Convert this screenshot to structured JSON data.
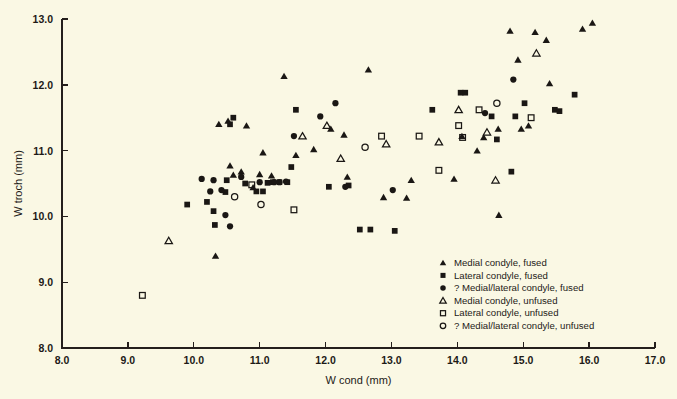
{
  "figure": {
    "background_color": "#faf8e4",
    "ink_color": "#1a1714"
  },
  "chart_data": {
    "type": "scatter",
    "title": "",
    "xlabel": "W cond (mm)",
    "ylabel": "W troch (mm)",
    "xlim": [
      8.0,
      17.0
    ],
    "ylim": [
      8.0,
      13.0
    ],
    "xticks": [
      "8.0",
      "9.0",
      "10.0",
      "11.0",
      "12.0",
      "13.0",
      "14.0",
      "15.0",
      "16.0",
      "17.0"
    ],
    "yticks": [
      "8.0",
      "9.0",
      "10.0",
      "11.0",
      "12.0",
      "13.0"
    ],
    "grid": false,
    "legend_position": "lower-right",
    "series": [
      {
        "name": "Medial condyle, fused",
        "marker": "filled-triangle",
        "points": [
          [
            10.55,
            10.77
          ],
          [
            10.72,
            10.68
          ],
          [
            10.6,
            10.63
          ],
          [
            10.9,
            10.44
          ],
          [
            11.05,
            10.97
          ],
          [
            11.0,
            10.64
          ],
          [
            11.18,
            10.62
          ],
          [
            11.37,
            12.13
          ],
          [
            11.55,
            10.93
          ],
          [
            11.82,
            11.02
          ],
          [
            12.08,
            11.33
          ],
          [
            12.28,
            11.24
          ],
          [
            12.65,
            12.23
          ],
          [
            12.33,
            10.6
          ],
          [
            12.88,
            10.29
          ],
          [
            13.23,
            10.28
          ],
          [
            13.3,
            10.55
          ],
          [
            13.95,
            10.57
          ],
          [
            14.07,
            11.22
          ],
          [
            14.3,
            11.0
          ],
          [
            14.4,
            11.2
          ],
          [
            14.62,
            11.33
          ],
          [
            14.8,
            12.82
          ],
          [
            14.97,
            11.33
          ],
          [
            14.92,
            12.38
          ],
          [
            15.08,
            11.38
          ],
          [
            15.18,
            12.8
          ],
          [
            15.35,
            12.68
          ],
          [
            15.4,
            12.02
          ],
          [
            15.9,
            12.85
          ],
          [
            16.05,
            12.94
          ],
          [
            10.38,
            11.4
          ],
          [
            10.52,
            11.45
          ],
          [
            10.8,
            11.38
          ],
          [
            14.63,
            10.02
          ],
          [
            10.33,
            9.4
          ]
        ]
      },
      {
        "name": "Lateral condyle, fused",
        "marker": "filled-square",
        "points": [
          [
            10.3,
            10.08
          ],
          [
            10.32,
            9.87
          ],
          [
            10.5,
            10.55
          ],
          [
            10.48,
            10.37
          ],
          [
            10.55,
            11.4
          ],
          [
            10.6,
            11.5
          ],
          [
            10.78,
            10.5
          ],
          [
            10.95,
            10.38
          ],
          [
            11.05,
            10.38
          ],
          [
            11.12,
            10.51
          ],
          [
            11.2,
            10.52
          ],
          [
            11.3,
            10.52
          ],
          [
            11.42,
            10.52
          ],
          [
            11.48,
            10.75
          ],
          [
            11.55,
            11.62
          ],
          [
            12.05,
            10.45
          ],
          [
            12.35,
            10.47
          ],
          [
            12.52,
            9.8
          ],
          [
            12.68,
            9.8
          ],
          [
            13.05,
            9.78
          ],
          [
            13.62,
            11.62
          ],
          [
            14.05,
            11.88
          ],
          [
            14.12,
            11.88
          ],
          [
            14.52,
            11.52
          ],
          [
            14.6,
            11.17
          ],
          [
            14.82,
            10.68
          ],
          [
            14.88,
            11.52
          ],
          [
            15.02,
            11.72
          ],
          [
            15.48,
            11.62
          ],
          [
            15.55,
            11.6
          ],
          [
            15.78,
            11.85
          ],
          [
            10.2,
            10.22
          ],
          [
            9.9,
            10.18
          ]
        ]
      },
      {
        "name": "? Medial/lateral condyle, fused",
        "marker": "filled-circle",
        "points": [
          [
            10.12,
            10.57
          ],
          [
            10.3,
            10.55
          ],
          [
            10.48,
            10.02
          ],
          [
            10.55,
            9.85
          ],
          [
            10.72,
            10.6
          ],
          [
            11.0,
            10.52
          ],
          [
            11.22,
            10.52
          ],
          [
            11.3,
            10.52
          ],
          [
            11.4,
            10.53
          ],
          [
            11.52,
            11.22
          ],
          [
            11.92,
            11.52
          ],
          [
            12.15,
            11.72
          ],
          [
            12.3,
            10.45
          ],
          [
            13.02,
            10.4
          ],
          [
            14.42,
            11.57
          ],
          [
            14.85,
            12.08
          ],
          [
            10.25,
            10.38
          ],
          [
            10.42,
            10.4
          ]
        ]
      },
      {
        "name": "Medial condyle, unfused",
        "marker": "open-triangle",
        "points": [
          [
            9.62,
            9.63
          ],
          [
            11.65,
            11.22
          ],
          [
            12.02,
            11.38
          ],
          [
            12.23,
            10.88
          ],
          [
            12.92,
            11.1
          ],
          [
            13.72,
            11.13
          ],
          [
            14.02,
            11.62
          ],
          [
            14.45,
            11.28
          ],
          [
            15.2,
            12.48
          ],
          [
            14.58,
            10.55
          ]
        ]
      },
      {
        "name": "Lateral condyle, unfused",
        "marker": "open-square",
        "points": [
          [
            9.22,
            8.8
          ],
          [
            10.88,
            10.48
          ],
          [
            11.52,
            10.1
          ],
          [
            12.85,
            11.22
          ],
          [
            13.42,
            11.22
          ],
          [
            14.02,
            11.38
          ],
          [
            14.08,
            11.2
          ],
          [
            13.72,
            10.7
          ],
          [
            15.12,
            11.5
          ],
          [
            14.33,
            11.62
          ]
        ]
      },
      {
        "name": "? Medial/lateral condyle, unfused",
        "marker": "open-circle",
        "points": [
          [
            10.62,
            10.3
          ],
          [
            11.02,
            10.18
          ],
          [
            12.6,
            11.05
          ],
          [
            14.6,
            11.72
          ]
        ]
      }
    ]
  },
  "legend": {
    "items": [
      {
        "marker": "filled-triangle",
        "label": "Medial condyle, fused"
      },
      {
        "marker": "filled-square",
        "label": "Lateral condyle, fused"
      },
      {
        "marker": "filled-circle",
        "label": "? Medial/lateral condyle, fused"
      },
      {
        "marker": "open-triangle",
        "label": "Medial condyle, unfused"
      },
      {
        "marker": "open-square",
        "label": "Lateral condyle, unfused"
      },
      {
        "marker": "open-circle",
        "label": "? Medial/lateral condyle, unfused"
      }
    ]
  }
}
